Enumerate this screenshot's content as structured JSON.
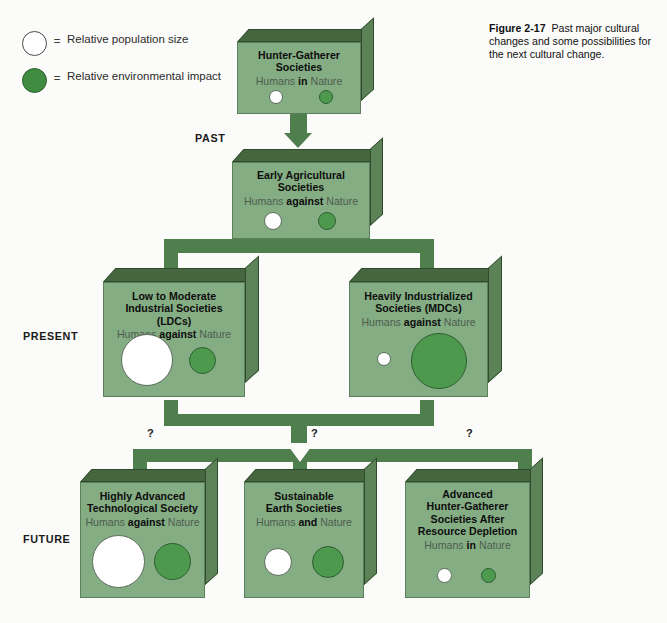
{
  "figure": {
    "label": "Figure 2-17",
    "caption": "Past major cultural changes and some possibilities for the next cultural change.",
    "background": "#fbfbf9"
  },
  "legend": {
    "items": [
      {
        "swatch": "white-circle",
        "eq": "=",
        "text": "Relative population size"
      },
      {
        "swatch": "green-circle",
        "eq": "=",
        "text": "Relative environmental impact"
      }
    ]
  },
  "eras": [
    {
      "id": "past",
      "label": "PAST"
    },
    {
      "id": "present",
      "label": "PRESENT"
    },
    {
      "id": "future",
      "label": "FUTURE"
    }
  ],
  "colors": {
    "box_face": "#85ad84",
    "box_top": "#45663f",
    "box_side": "#5c8257",
    "connector": "#4f7f4c",
    "population_circle": "#ffffff",
    "impact_circle": "#4d9a4f"
  },
  "nodes": [
    {
      "id": "hunter-gatherer",
      "title_lines": [
        "Hunter-Gatherer",
        "Societies"
      ],
      "relation_prefix": "Humans ",
      "relation_emphasis": "in",
      "relation_suffix": " Nature",
      "population_size": "small",
      "impact_size": "small"
    },
    {
      "id": "early-agricultural",
      "title_lines": [
        "Early Agricultural",
        "Societies"
      ],
      "relation_prefix": "Humans ",
      "relation_emphasis": "against",
      "relation_suffix": " Nature",
      "population_size": "medium-small",
      "impact_size": "medium-small"
    },
    {
      "id": "ldcs",
      "title_lines": [
        "Low to Moderate",
        "Industrial Societies (LDCs)"
      ],
      "relation_prefix": "Humans ",
      "relation_emphasis": "against",
      "relation_suffix": " Nature",
      "population_size": "large",
      "impact_size": "medium"
    },
    {
      "id": "mdcs",
      "title_lines": [
        "Heavily Industrialized",
        "Societies (MDCs)"
      ],
      "relation_prefix": "Humans ",
      "relation_emphasis": "against",
      "relation_suffix": " Nature",
      "population_size": "very-small",
      "impact_size": "very-large"
    },
    {
      "id": "highly-advanced-technological",
      "title_lines": [
        "Highly Advanced",
        "Technological Society"
      ],
      "relation_prefix": "Humans ",
      "relation_emphasis": "against",
      "relation_suffix": " Nature",
      "population_size": "large",
      "impact_size": "medium"
    },
    {
      "id": "sustainable-earth",
      "title_lines": [
        "Sustainable",
        "Earth Societies"
      ],
      "relation_prefix": "Humans ",
      "relation_emphasis": "and",
      "relation_suffix": " Nature",
      "population_size": "medium-small",
      "impact_size": "medium"
    },
    {
      "id": "advanced-hunter-gatherer",
      "title_lines": [
        "Advanced",
        "Hunter-Gatherer",
        "Societies After",
        "Resource Depletion"
      ],
      "relation_prefix": "Humans ",
      "relation_emphasis": "in",
      "relation_suffix": " Nature",
      "population_size": "small",
      "impact_size": "small"
    }
  ],
  "uncertainty_marks": [
    {
      "id": "q-left",
      "label": "?"
    },
    {
      "id": "q-center",
      "label": "?"
    },
    {
      "id": "q-right",
      "label": "?"
    }
  ]
}
